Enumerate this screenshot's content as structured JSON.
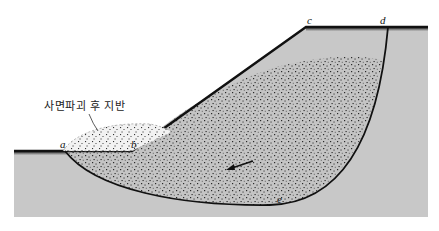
{
  "diagram": {
    "labels": {
      "a": "a",
      "b": "b",
      "c": "c",
      "d": "d",
      "e": "e",
      "failed_ground": "사면파괴 후 지반"
    },
    "colors": {
      "ground_fill": "#c8c8c8",
      "surface_line": "#111111",
      "slip_line": "#111111",
      "stipple_fill": "#bdbdbd",
      "stipple_dot": "#333333",
      "background": "#ffffff"
    },
    "elements": [
      "ground-cross-section",
      "slope-surface",
      "slip-circle-arc",
      "sliding-mass",
      "failed-ground-mound",
      "movement-arrow"
    ]
  }
}
